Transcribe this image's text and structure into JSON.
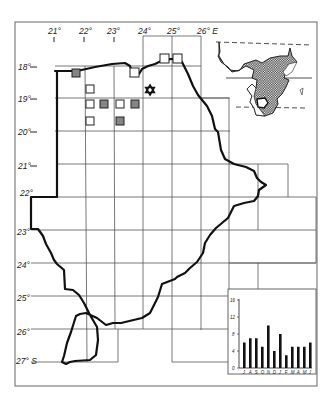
{
  "map": {
    "longitude_labels": [
      {
        "label": "21°",
        "x": 53
      },
      {
        "label": "22°",
        "x": 84
      },
      {
        "label": "23°",
        "x": 113
      },
      {
        "label": "24°",
        "x": 144
      },
      {
        "label": "25°",
        "x": 172
      },
      {
        "label": "26° E",
        "x": 208
      }
    ],
    "latitude_labels": [
      {
        "label": "18°",
        "y": 68
      },
      {
        "label": "19°",
        "y": 100
      },
      {
        "label": "20°",
        "y": 133
      },
      {
        "label": "21°",
        "y": 167
      },
      {
        "label": "22°",
        "y": 196
      },
      {
        "label": "23°",
        "y": 233
      },
      {
        "label": "24°",
        "y": 266
      },
      {
        "label": "25°",
        "y": 299
      },
      {
        "label": "26°",
        "y": 333
      },
      {
        "label": "27° S",
        "y": 362
      }
    ],
    "symbols": {
      "open_square": "record",
      "hatched_square": "record-hatched",
      "star": "type-locality"
    },
    "inset": {
      "region": "Africa",
      "shading": "stippled distribution"
    }
  },
  "chart_data": {
    "type": "bar",
    "title": "",
    "xlabel": "",
    "ylabel": "",
    "categories": [
      "J",
      "A",
      "S",
      "O",
      "N",
      "D",
      "J",
      "F",
      "M",
      "A",
      "M",
      "J"
    ],
    "values": [
      6,
      7,
      7,
      5,
      10,
      4,
      8,
      3,
      5,
      5,
      5,
      6
    ],
    "ylim": [
      0,
      16
    ],
    "yticks": [
      0,
      4,
      8,
      12,
      16
    ],
    "grid": false
  },
  "chart_labels": {
    "yticks": [
      "0",
      "4",
      "8",
      "12",
      "16"
    ],
    "months": [
      "J",
      "A",
      "S",
      "O",
      "N",
      "D",
      "J",
      "F",
      "M",
      "A",
      "M",
      "J"
    ]
  }
}
